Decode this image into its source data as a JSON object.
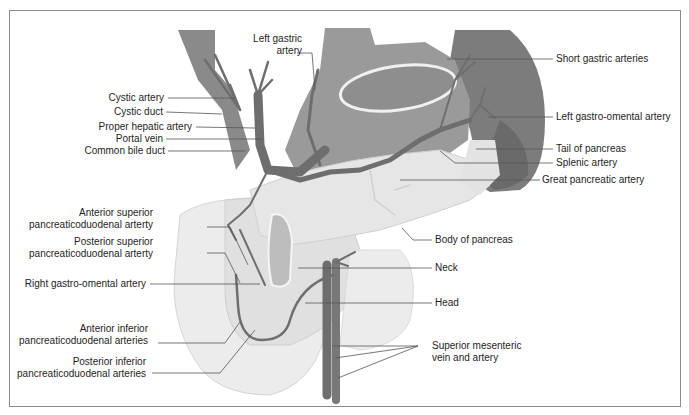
{
  "figure": {
    "colors": {
      "frame": "#8c8c8c",
      "vessel": "#6e6e6e",
      "vessel_outline": "#4a4a4a",
      "stomach": "#9a9a9a",
      "spleen": "#7c7c7c",
      "pancreas": "#e3e3e3",
      "duodenum": "#ececec",
      "leader_line": "#555555",
      "text": "#1e1e1e"
    }
  },
  "labels_left": [
    {
      "id": "cystic-artery",
      "text": "Cystic artery"
    },
    {
      "id": "cystic-duct",
      "text": "Cystic duct"
    },
    {
      "id": "proper-hepatic-artery",
      "text": "Proper hepatic artery"
    },
    {
      "id": "portal-vein",
      "text": "Portal vein"
    },
    {
      "id": "common-bile-duct",
      "text": "Common bile duct"
    },
    {
      "id": "anterior-superior-pd-artery",
      "line1": "Anterior superior",
      "line2": "pancreaticoduodenal arterty"
    },
    {
      "id": "posterior-superior-pd-artery",
      "line1": "Posterior superior",
      "line2": "pancreaticoduodenal arterty"
    },
    {
      "id": "right-gastro-omental-artery",
      "text": "Right gastro-omental artery"
    },
    {
      "id": "anterior-inferior-pd-arteries",
      "line1": "Anterior inferior",
      "line2": "pancreaticoduodenal arteries"
    },
    {
      "id": "posterior-inferior-pd-arteries",
      "line1": "Posterior inferior",
      "line2": "pancreaticoduodenal arteries"
    }
  ],
  "labels_top": [
    {
      "id": "left-gastric-artery",
      "line1": "Left gastric",
      "line2": "artery"
    }
  ],
  "labels_right": [
    {
      "id": "short-gastric-arteries",
      "text": "Short gastric arteries"
    },
    {
      "id": "left-gastro-omental-artery",
      "text": "Left gastro-omental artery"
    },
    {
      "id": "tail-of-pancreas",
      "text": "Tail of pancreas"
    },
    {
      "id": "splenic-artery",
      "text": "Splenic artery"
    },
    {
      "id": "great-pancreatic-artery",
      "text": "Great pancreatic artery"
    },
    {
      "id": "body-of-pancreas",
      "text": "Body of pancreas"
    },
    {
      "id": "neck",
      "text": "Neck"
    },
    {
      "id": "head",
      "text": "Head"
    },
    {
      "id": "superior-mesenteric-vessels",
      "line1": "Superior mesenteric",
      "line2": "vein and artery"
    }
  ]
}
